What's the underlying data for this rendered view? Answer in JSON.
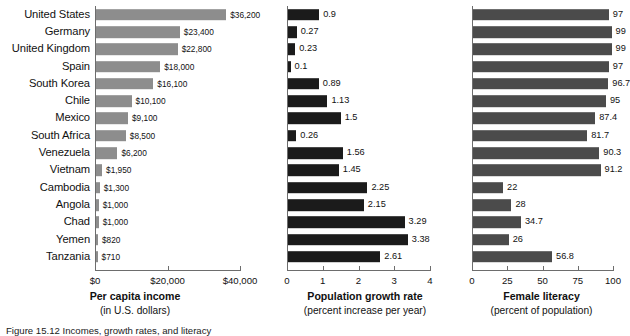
{
  "caption": "Figure 15.12   Incomes, growth rates, and literacy",
  "colors": {
    "income_bar": "#8d8d8d",
    "growth_bar": "#1b1b1b",
    "literacy_bar": "#4b4b4b",
    "axis": "#6d6d6d",
    "background": "#ffffff"
  },
  "categories": [
    "United States",
    "Germany",
    "United Kingdom",
    "Spain",
    "South Korea",
    "Chile",
    "Mexico",
    "South Africa",
    "Venezuela",
    "Vietnam",
    "Cambodia",
    "Angola",
    "Chad",
    "Yemen",
    "Tanzania"
  ],
  "chart_data": [
    {
      "type": "bar",
      "orientation": "horizontal",
      "title": "Per capita income",
      "subtitle": "(in U.S. dollars)",
      "xlabel": "Per capita income",
      "ylabel": "",
      "xlim": [
        0,
        40000
      ],
      "ticks": [
        0,
        20000,
        40000
      ],
      "ticklabels": [
        "$0",
        "$20,000",
        "$40,000"
      ],
      "grid": false,
      "legend": false,
      "categories": [
        "United States",
        "Germany",
        "United Kingdom",
        "Spain",
        "South Korea",
        "Chile",
        "Mexico",
        "South Africa",
        "Venezuela",
        "Vietnam",
        "Cambodia",
        "Angola",
        "Chad",
        "Yemen",
        "Tanzania"
      ],
      "values": [
        36200,
        23400,
        22800,
        18000,
        16100,
        10100,
        9100,
        8500,
        6200,
        1950,
        1300,
        1000,
        1000,
        820,
        710
      ],
      "datalabels": [
        "$36,200",
        "$23,400",
        "$22,800",
        "$18,000",
        "$16,100",
        "$10,100",
        "$9,100",
        "$8,500",
        "$6,200",
        "$1,950",
        "$1,300",
        "$1,000",
        "$1,000",
        "$820",
        "$710"
      ]
    },
    {
      "type": "bar",
      "orientation": "horizontal",
      "title": "Population growth rate",
      "subtitle": "(percent increase per year)",
      "xlabel": "Population growth rate",
      "ylabel": "",
      "xlim": [
        0,
        4
      ],
      "ticks": [
        0,
        1,
        2,
        3,
        4
      ],
      "ticklabels": [
        "0",
        "1",
        "2",
        "3",
        "4"
      ],
      "grid": false,
      "legend": false,
      "categories": [
        "United States",
        "Germany",
        "United Kingdom",
        "Spain",
        "South Korea",
        "Chile",
        "Mexico",
        "South Africa",
        "Venezuela",
        "Vietnam",
        "Cambodia",
        "Angola",
        "Chad",
        "Yemen",
        "Tanzania"
      ],
      "values": [
        0.9,
        0.27,
        0.23,
        0.1,
        0.89,
        1.13,
        1.5,
        0.26,
        1.56,
        1.45,
        2.25,
        2.15,
        3.29,
        3.38,
        2.61
      ],
      "datalabels": [
        "0.9",
        "0.27",
        "0.23",
        "0.1",
        "0.89",
        "1.13",
        "1.5",
        "0.26",
        "1.56",
        "1.45",
        "2.25",
        "2.15",
        "3.29",
        "3.38",
        "2.61"
      ]
    },
    {
      "type": "bar",
      "orientation": "horizontal",
      "title": "Female literacy",
      "subtitle": "(percent of population)",
      "xlabel": "Female literacy",
      "ylabel": "",
      "xlim": [
        0,
        100
      ],
      "ticks": [
        0,
        25,
        50,
        75,
        100
      ],
      "ticklabels": [
        "0",
        "25",
        "50",
        "75",
        "100"
      ],
      "grid": false,
      "legend": false,
      "categories": [
        "United States",
        "Germany",
        "United Kingdom",
        "Spain",
        "South Korea",
        "Chile",
        "Mexico",
        "South Africa",
        "Venezuela",
        "Vietnam",
        "Cambodia",
        "Angola",
        "Chad",
        "Yemen",
        "Tanzania"
      ],
      "values": [
        97,
        99,
        99,
        97,
        96.7,
        95,
        87.4,
        81.7,
        90.3,
        91.2,
        22,
        28,
        34.7,
        26,
        56.8
      ],
      "datalabels": [
        "97",
        "99",
        "99",
        "97",
        "96.7",
        "95",
        "87.4",
        "81.7",
        "90.3",
        "91.2",
        "22",
        "28",
        "34.7",
        "26",
        "56.8"
      ]
    }
  ]
}
